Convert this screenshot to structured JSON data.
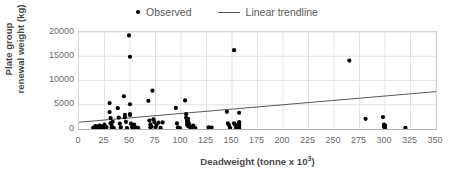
{
  "chart_data": {
    "type": "scatter",
    "title": "",
    "xlabel": "Deadweight (tonne x 10³)",
    "ylabel_line1": "Plate group",
    "ylabel_line2": "renewal weight (kg)",
    "xlim": [
      0,
      350
    ],
    "ylim": [
      0,
      20000
    ],
    "xticks": [
      0,
      25,
      50,
      75,
      100,
      125,
      150,
      175,
      200,
      225,
      250,
      275,
      300,
      325,
      350
    ],
    "yticks": [
      0,
      5000,
      10000,
      15000,
      20000
    ],
    "grid": true,
    "legend_position": "top-center",
    "legend": [
      {
        "label": "Observed",
        "marker": "dot",
        "color": "#000000"
      },
      {
        "label": "Linear trendline",
        "marker": "line",
        "color": "#595959"
      }
    ],
    "series": [
      {
        "name": "Observed",
        "marker": "dot",
        "color": "#000000",
        "points": [
          [
            14,
            300
          ],
          [
            15,
            150
          ],
          [
            16,
            600
          ],
          [
            17,
            250
          ],
          [
            18,
            500
          ],
          [
            19,
            350
          ],
          [
            20,
            700
          ],
          [
            21,
            200
          ],
          [
            22,
            450
          ],
          [
            23,
            600
          ],
          [
            24,
            300
          ],
          [
            25,
            900
          ],
          [
            26,
            250
          ],
          [
            27,
            400
          ],
          [
            30,
            5350
          ],
          [
            30,
            3500
          ],
          [
            31,
            2250
          ],
          [
            31,
            1200
          ],
          [
            32,
            800
          ],
          [
            32,
            300
          ],
          [
            33,
            1500
          ],
          [
            34,
            250
          ],
          [
            38,
            4300
          ],
          [
            39,
            2350
          ],
          [
            40,
            1100
          ],
          [
            41,
            350
          ],
          [
            44,
            6750
          ],
          [
            45,
            2900
          ],
          [
            45,
            2400
          ],
          [
            46,
            1450
          ],
          [
            47,
            200
          ],
          [
            49,
            19300
          ],
          [
            50,
            14900
          ],
          [
            50,
            5100
          ],
          [
            50,
            3050
          ],
          [
            50,
            2900
          ],
          [
            51,
            1100
          ],
          [
            52,
            400
          ],
          [
            53,
            250
          ],
          [
            54,
            900
          ],
          [
            55,
            350
          ],
          [
            57,
            300
          ],
          [
            58,
            200
          ],
          [
            68,
            5800
          ],
          [
            69,
            1750
          ],
          [
            70,
            950
          ],
          [
            70,
            350
          ],
          [
            71,
            500
          ],
          [
            72,
            7900
          ],
          [
            73,
            2000
          ],
          [
            74,
            1400
          ],
          [
            75,
            300
          ],
          [
            76,
            800
          ],
          [
            78,
            1300
          ],
          [
            80,
            250
          ],
          [
            82,
            1350
          ],
          [
            95,
            4350
          ],
          [
            96,
            1150
          ],
          [
            97,
            350
          ],
          [
            98,
            250
          ],
          [
            99,
            150
          ],
          [
            104,
            5900
          ],
          [
            105,
            3050
          ],
          [
            105,
            2300
          ],
          [
            106,
            1750
          ],
          [
            106,
            1300
          ],
          [
            106,
            900
          ],
          [
            107,
            2100
          ],
          [
            107,
            1500
          ],
          [
            107,
            600
          ],
          [
            108,
            1050
          ],
          [
            109,
            350
          ],
          [
            110,
            250
          ],
          [
            112,
            700
          ],
          [
            114,
            200
          ],
          [
            127,
            350
          ],
          [
            130,
            300
          ],
          [
            145,
            3550
          ],
          [
            146,
            1150
          ],
          [
            147,
            800
          ],
          [
            148,
            250
          ],
          [
            152,
            16250
          ],
          [
            152,
            1150
          ],
          [
            153,
            900
          ],
          [
            154,
            250
          ],
          [
            157,
            3350
          ],
          [
            157,
            1400
          ],
          [
            157,
            1000
          ],
          [
            157,
            600
          ],
          [
            157,
            250
          ],
          [
            265,
            14100
          ],
          [
            281,
            2100
          ],
          [
            298,
            2450
          ],
          [
            299,
            900
          ],
          [
            299,
            500
          ],
          [
            300,
            700
          ],
          [
            300,
            250
          ],
          [
            320,
            250
          ]
        ]
      }
    ],
    "trendline": {
      "name": "Linear trendline",
      "color": "#595959",
      "x_start": 0,
      "y_start": 1400,
      "x_end": 350,
      "y_end": 7700
    }
  }
}
